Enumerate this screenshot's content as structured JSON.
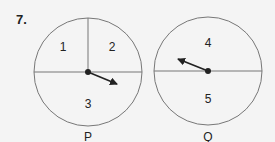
{
  "question_number": "7.",
  "spinners": [
    {
      "name": "P",
      "sections": [
        "1",
        "2",
        "3"
      ],
      "pointer_section": "3"
    },
    {
      "name": "Q",
      "sections": [
        "4",
        "5"
      ],
      "pointer_section": "4"
    }
  ],
  "colors": {
    "line": "#777777",
    "arrow": "#222222",
    "background": "#f4f4f4"
  }
}
